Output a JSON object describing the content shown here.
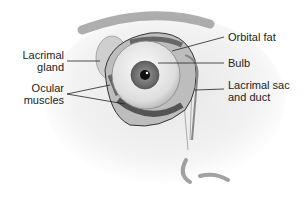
{
  "diagram": {
    "labels": {
      "lacrimal_gland": {
        "line1": "Lacrimal",
        "line2": "gland"
      },
      "ocular_muscles": {
        "line1": "Ocular",
        "line2": "muscles"
      },
      "orbital_fat": "Orbital fat",
      "bulb": "Bulb",
      "lacrimal_sac": {
        "line1": "Lacrimal sac",
        "line2": "and duct"
      }
    },
    "colors": {
      "skin_shadow": "#c8c8c8",
      "brow": "#8a8a8a",
      "sclera": "#efefef",
      "iris": "#7a7a7a",
      "pupil": "#111111",
      "muscle": "#666666",
      "gland": "#c4c4c4",
      "leader": "#222222"
    }
  }
}
